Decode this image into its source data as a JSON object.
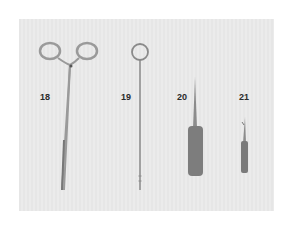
{
  "figure": {
    "background_color": "#e8e8e8",
    "instruments": [
      {
        "number": "18",
        "type": "hemostat-forceps"
      },
      {
        "number": "19",
        "type": "ring-probe"
      },
      {
        "number": "20",
        "type": "awl-elevator"
      },
      {
        "number": "21",
        "type": "small-hook-probe"
      }
    ]
  }
}
